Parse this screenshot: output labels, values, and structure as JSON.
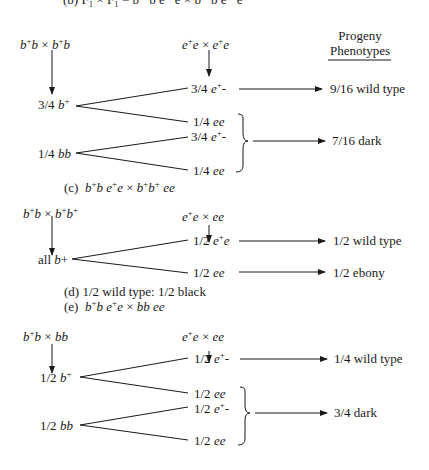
{
  "top_line": "(b) F₁ × F₁ = b⁺ b e⁺ e × b⁺ b e⁺ e",
  "header": {
    "line1": "Progeny",
    "line2": "Phenotypes"
  },
  "section_b": {
    "cross_b": "b⁺b × b⁺b",
    "cross_e": "e⁺e × e⁺e",
    "b_classes": [
      "3/4 b⁺",
      "1/4 bb"
    ],
    "e_classes": [
      "3/4 e⁺-",
      "1/4 ee",
      "3/4 e⁺-",
      "1/4 ee"
    ],
    "phenotypes": [
      "9/16 wild type",
      "7/16 dark"
    ]
  },
  "label_c": "(c) b⁺b e⁺e × b⁺b⁺ ee",
  "section_c": {
    "cross_b": "b⁺b × b⁺b⁺",
    "cross_e": "e⁺e × ee",
    "b_classes": [
      "all b+"
    ],
    "e_classes": [
      "1/2 e⁺e",
      "1/2 ee"
    ],
    "phenotypes": [
      "1/2 wild type",
      "1/2 ebony"
    ]
  },
  "label_d": "(d) 1/2 wild type:  1/2 black",
  "label_e": "(e) b⁺b e⁺e × bb ee",
  "section_e": {
    "cross_b": "b⁺b × bb",
    "cross_e": "e⁺e × ee",
    "b_classes": [
      "1/2 b⁺",
      "1/2 bb"
    ],
    "e_classes": [
      "1/2 e⁺-",
      "1/2 ee",
      "1/2 e⁺-",
      "1/2 ee"
    ],
    "phenotypes": [
      "1/4 wild type",
      "3/4 dark"
    ]
  }
}
